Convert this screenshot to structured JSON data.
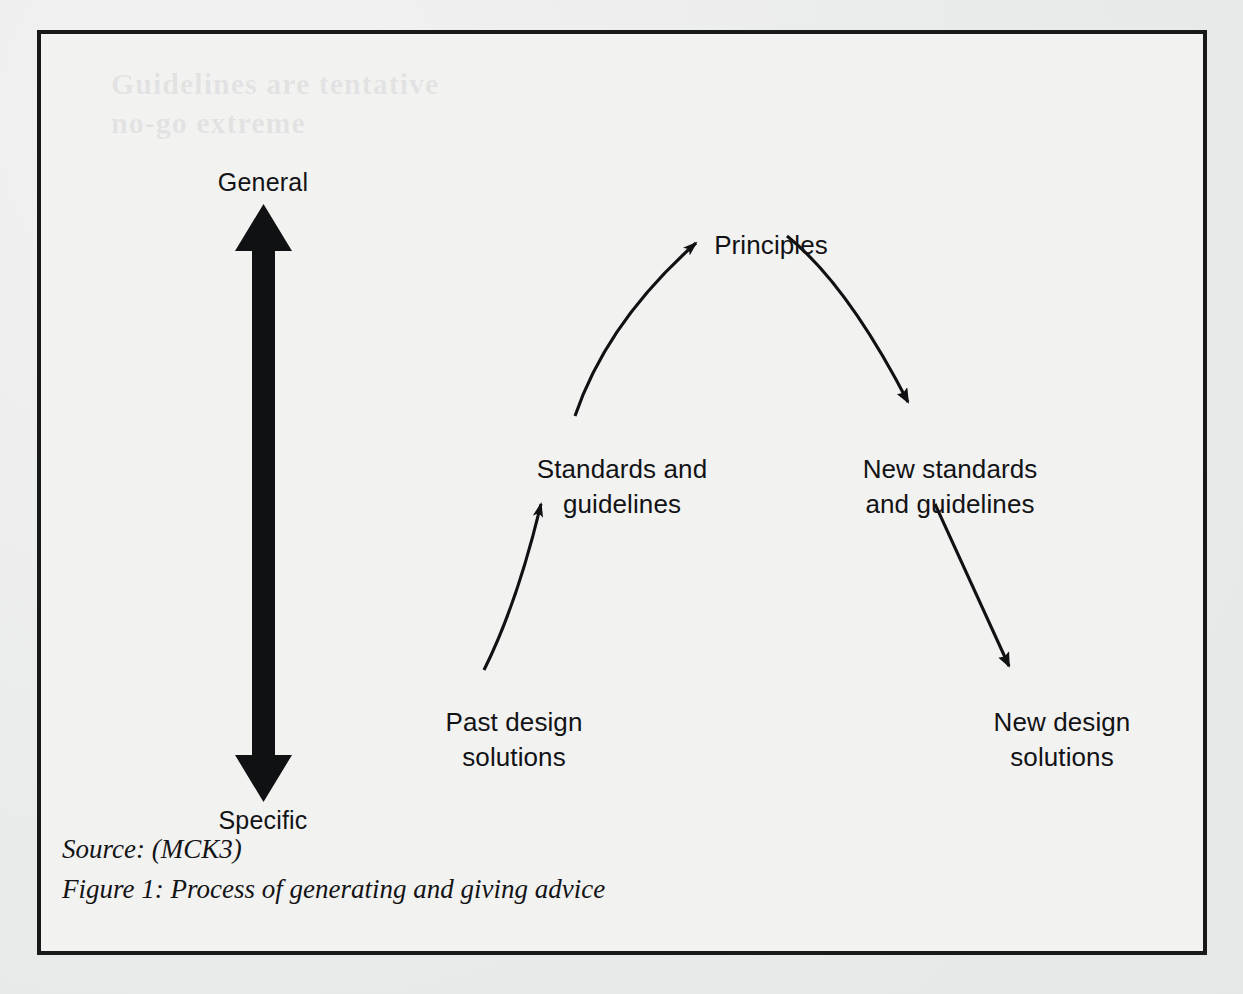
{
  "figure": {
    "border_color": "#18191b",
    "page_background": "#eceded",
    "frame_background": "#f2f2f1",
    "ink_color": "#121315"
  },
  "axis": {
    "name": "generality-axis",
    "top_label": "General",
    "bottom_label": "Specific",
    "icon": "double-headed-vertical-arrow"
  },
  "nodes": [
    {
      "id": "principles",
      "lines": [
        "Principles"
      ]
    },
    {
      "id": "standards",
      "lines": [
        "Standards and",
        "guidelines"
      ]
    },
    {
      "id": "new_standards",
      "lines": [
        "New standards",
        "and guidelines"
      ]
    },
    {
      "id": "past_solutions",
      "lines": [
        "Past design",
        "solutions"
      ]
    },
    {
      "id": "new_solutions",
      "lines": [
        "New design",
        "solutions"
      ]
    }
  ],
  "node_text": {
    "principles_1": "Principles",
    "standards_1": "Standards and",
    "standards_2": "guidelines",
    "new_standards_1": "New standards",
    "new_standards_2": "and guidelines",
    "past_solutions_1": "Past design",
    "past_solutions_2": "solutions",
    "new_solutions_1": "New design",
    "new_solutions_2": "solutions"
  },
  "arrows": [
    {
      "id": "past-to-standards",
      "from": "past_solutions",
      "to": "standards",
      "style": "straight",
      "direction": "up-right"
    },
    {
      "id": "standards-to-principles",
      "from": "standards",
      "to": "principles",
      "style": "curved",
      "direction": "up-right"
    },
    {
      "id": "principles-to-new-standards",
      "from": "principles",
      "to": "new_standards",
      "style": "curved",
      "direction": "down-right"
    },
    {
      "id": "new-standards-to-new-solutions",
      "from": "new_standards",
      "to": "new_solutions",
      "style": "straight",
      "direction": "down-right"
    }
  ],
  "caption": {
    "source": "Source: (MCK3)",
    "figure_title": "Figure 1: Process of generating and giving advice"
  },
  "ghost_text": {
    "line1": "Guidelines are tentative",
    "line2": "no-go extreme"
  }
}
